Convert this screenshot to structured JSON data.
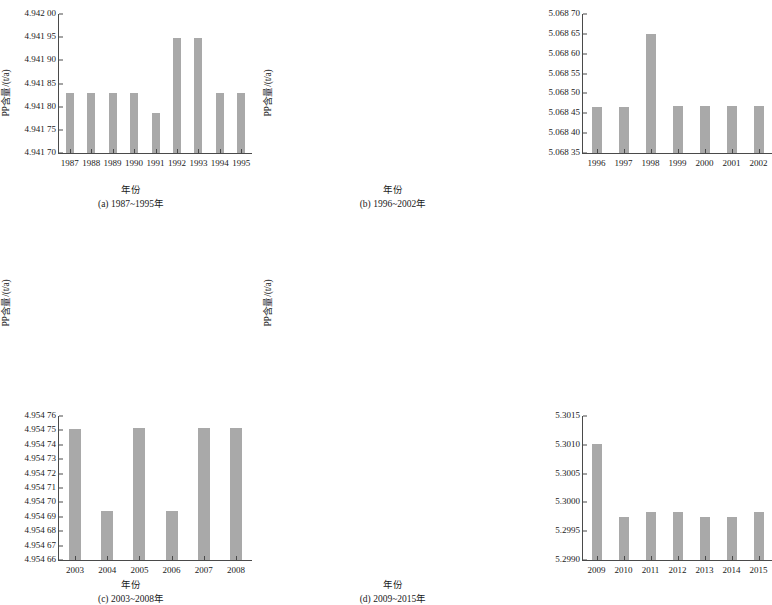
{
  "figure": {
    "ylabel": "PP含量/(t/a)",
    "xlabel": "年份",
    "bar_color": "#a9a9a9",
    "axis_color": "#4a4a4a"
  },
  "chart_data": [
    {
      "id": "a",
      "type": "bar",
      "title": "",
      "caption": "(a) 1987~1995年",
      "xlabel": "年份",
      "ylabel": "PP含量/(t/a)",
      "categories": [
        "1987",
        "1988",
        "1989",
        "1990",
        "1991",
        "1992",
        "1993",
        "1994",
        "1995"
      ],
      "values": [
        4.94183,
        4.94183,
        4.94183,
        4.94183,
        4.941787,
        4.941948,
        4.941948,
        4.94183,
        4.94183
      ],
      "ylim": [
        4.9417,
        4.942
      ],
      "ytick_step": 5e-05,
      "ytick_labels": [
        "4.942 00",
        "4.941 95",
        "4.941 90",
        "4.941 85",
        "4.941 80",
        "4.941 75",
        "4.941 70"
      ],
      "ytick_values": [
        4.942,
        4.94195,
        4.9419,
        4.94185,
        4.9418,
        4.94175,
        4.9417
      ],
      "grid": false,
      "legend": "none"
    },
    {
      "id": "b",
      "type": "bar",
      "title": "",
      "caption": "(b) 1996~2002年",
      "xlabel": "年份",
      "ylabel": "PP含量/(t/a)",
      "categories": [
        "1996",
        "1997",
        "1998",
        "1999",
        "2000",
        "2001",
        "2002"
      ],
      "values": [
        5.068465,
        5.068465,
        5.06865,
        5.068468,
        5.068468,
        5.068468,
        5.068468
      ],
      "ylim": [
        5.06835,
        5.0687
      ],
      "ytick_step": 5e-05,
      "ytick_labels": [
        "5.068 70",
        "5.068 65",
        "5.068 60",
        "5.068 55",
        "5.068 50",
        "5.068 45",
        "5.068 40",
        "5.068 35"
      ],
      "ytick_values": [
        5.0687,
        5.06865,
        5.0686,
        5.06855,
        5.0685,
        5.06845,
        5.0684,
        5.06835
      ],
      "grid": false,
      "legend": "none"
    },
    {
      "id": "c",
      "type": "bar",
      "title": "",
      "caption": "(c) 2003~2008年",
      "xlabel": "年份",
      "ylabel": "PP含量/(t/a)",
      "categories": [
        "2003",
        "2004",
        "2005",
        "2006",
        "2007",
        "2008"
      ],
      "values": [
        4.954751,
        4.954694,
        4.954752,
        4.954694,
        4.954752,
        4.954752
      ],
      "ylim": [
        4.95466,
        4.95476
      ],
      "ytick_step": 1e-05,
      "ytick_labels": [
        "4.954 76",
        "4.954 75",
        "4.954 74",
        "4.954 73",
        "4.954 72",
        "4.954 71",
        "4.954 70",
        "4.954 69",
        "4.954 68",
        "4.954 67",
        "4.954 66"
      ],
      "ytick_values": [
        4.95476,
        4.95475,
        4.95474,
        4.95473,
        4.95472,
        4.95471,
        4.9547,
        4.95469,
        4.95468,
        4.95467,
        4.95466
      ],
      "grid": false,
      "legend": "none"
    },
    {
      "id": "d",
      "type": "bar",
      "title": "",
      "caption": "(d) 2009~2015年",
      "xlabel": "年份",
      "ylabel": "PP含量/(t/a)",
      "categories": [
        "2009",
        "2010",
        "2011",
        "2012",
        "2013",
        "2014",
        "2015"
      ],
      "values": [
        5.30101,
        5.299745,
        5.299825,
        5.299828,
        5.299748,
        5.299752,
        5.299835
      ],
      "ylim": [
        5.299,
        5.3015
      ],
      "ytick_step": 0.0005,
      "ytick_labels": [
        "5.3015",
        "5.3010",
        "5.3005",
        "5.3000",
        "5.2995",
        "5.2990"
      ],
      "ytick_values": [
        5.3015,
        5.301,
        5.3005,
        5.3,
        5.2995,
        5.299
      ],
      "grid": false,
      "legend": "none"
    }
  ]
}
